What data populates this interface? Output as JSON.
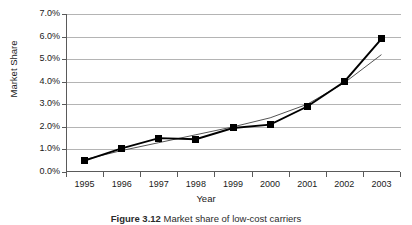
{
  "figure": {
    "caption_label": "Figure 3.12",
    "caption_text": "Market share of low-cost carriers",
    "caption_full": "Figure 3.12  Market share of low-cost carriers"
  },
  "axes": {
    "y_title": "Market Share",
    "x_title": "Year",
    "y_ticklabels": [
      "7.0%",
      "6.0%",
      "5.0%",
      "4.0%",
      "3.0%",
      "2.0%",
      "1.0%",
      "0.0%"
    ],
    "x_ticklabels": [
      "1995",
      "1996",
      "1997",
      "1998",
      "1999",
      "2000",
      "2001",
      "2002",
      "2003"
    ]
  },
  "colors": {
    "series_line": "#000000",
    "marker_fill": "#000000",
    "trendline": "#555555",
    "gridline": "#b4b4b4",
    "axis": "#5a5a5a",
    "background": "#ffffff",
    "text": "#1a1a1a"
  },
  "chart_data": {
    "type": "line",
    "title": "",
    "xlabel": "Year",
    "ylabel": "Market Share",
    "categories": [
      "1995",
      "1996",
      "1997",
      "1998",
      "1999",
      "2000",
      "2001",
      "2002",
      "2003"
    ],
    "x": [
      1995,
      1996,
      1997,
      1998,
      1999,
      2000,
      2001,
      2002,
      2003
    ],
    "ylim": [
      0.0,
      7.0
    ],
    "yticks": [
      0.0,
      1.0,
      2.0,
      3.0,
      4.0,
      5.0,
      6.0,
      7.0
    ],
    "ytick_format": "percent_one_decimal",
    "grid": "horizontal",
    "legend": "none",
    "series": [
      {
        "name": "Market share",
        "marker": "square",
        "values": [
          0.5,
          1.05,
          1.5,
          1.45,
          1.95,
          2.1,
          2.9,
          4.0,
          5.9
        ]
      },
      {
        "name": "Trend line",
        "marker": "none",
        "style": "thin smooth curve",
        "values": [
          0.55,
          0.95,
          1.3,
          1.65,
          2.0,
          2.4,
          3.0,
          3.95,
          5.2
        ]
      }
    ]
  }
}
